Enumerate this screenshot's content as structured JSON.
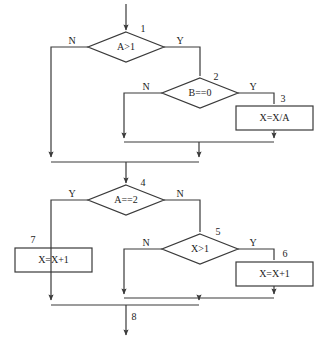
{
  "diagram": {
    "type": "flowchart",
    "background_color": "#ffffff",
    "line_color": "#3a3a3a",
    "text_color": "#1c1c1c",
    "entry_arrow": {
      "name": "entry",
      "x": 126,
      "y_start": 4,
      "y_end": 32
    },
    "exit_arrow": {
      "name": "exit",
      "x": 126,
      "y_start": 312,
      "y_end": 337,
      "label": "8"
    },
    "nodes": [
      {
        "id": "n1",
        "step": "1",
        "shape": "diamond",
        "text": "A>1",
        "cx": 126,
        "cy": 47,
        "hw": 38,
        "hh": 15,
        "step_x": 143,
        "step_y": 30,
        "yes_label": "Y",
        "yes_x": 180,
        "yes_y": 42,
        "no_label": "N",
        "no_x": 72,
        "no_y": 42
      },
      {
        "id": "n2",
        "step": "2",
        "shape": "diamond",
        "text": "B==0",
        "cx": 200,
        "cy": 93,
        "hw": 38,
        "hh": 15,
        "step_x": 216,
        "step_y": 78,
        "yes_label": "Y",
        "yes_x": 253,
        "yes_y": 88,
        "no_label": "N",
        "no_x": 146,
        "no_y": 88
      },
      {
        "id": "n3",
        "step": "3",
        "shape": "rect",
        "text": "X=X/A",
        "x": 236,
        "y": 106,
        "w": 77,
        "h": 24,
        "step_x": 283,
        "step_y": 100
      },
      {
        "id": "n4",
        "step": "4",
        "shape": "diamond",
        "text": "A==2",
        "cx": 126,
        "cy": 200,
        "hw": 38,
        "hh": 15,
        "step_x": 143,
        "step_y": 184,
        "yes_label": "Y",
        "yes_x": 72,
        "yes_y": 195,
        "no_label": "N",
        "no_x": 180,
        "no_y": 195
      },
      {
        "id": "n5",
        "step": "5",
        "shape": "diamond",
        "text": "X>1",
        "cx": 200,
        "cy": 249,
        "hw": 38,
        "hh": 15,
        "step_x": 218,
        "step_y": 233,
        "yes_label": "Y",
        "yes_x": 253,
        "yes_y": 244,
        "no_label": "N",
        "no_x": 146,
        "no_y": 244
      },
      {
        "id": "n6",
        "step": "6",
        "shape": "rect",
        "text": "X=X+1",
        "x": 236,
        "y": 262,
        "w": 77,
        "h": 24,
        "step_x": 285,
        "step_y": 255
      },
      {
        "id": "n7",
        "step": "7",
        "shape": "rect",
        "text": "X=X+1",
        "x": 15,
        "y": 248,
        "w": 77,
        "h": 24,
        "step_x": 33,
        "step_y": 241
      }
    ],
    "edges": [
      {
        "name": "entry-to-n1",
        "points": "126,4 126,30",
        "arrow": true
      },
      {
        "name": "n1-no-left",
        "points": "88,47 51,47 51,157",
        "arrow": true
      },
      {
        "name": "n1-yes-right",
        "points": "164,47 200,47 200,76",
        "arrow": false
      },
      {
        "name": "n2-no-left",
        "points": "162,93 124,93 124,138",
        "arrow": true
      },
      {
        "name": "n2-yes-right",
        "points": "238,93 274,93 274,104",
        "arrow": false
      },
      {
        "name": "n3-bottom-down",
        "points": "274,130 274,138",
        "arrow": true
      },
      {
        "name": "inner-merge-upper",
        "points": "124,142 274,142",
        "arrow": false
      },
      {
        "name": "inner-merge-down",
        "points": "199,142 199,157",
        "arrow": true
      },
      {
        "name": "outer-merge-upper",
        "points": "51,162 199,162",
        "arrow": false
      },
      {
        "name": "merge-to-n4",
        "points": "126,162 126,183",
        "arrow": true
      },
      {
        "name": "n4-yes-left",
        "points": "88,200 51,200 51,300",
        "arrow": true
      },
      {
        "name": "n4-no-right",
        "points": "164,200 200,200 200,232",
        "arrow": false
      },
      {
        "name": "n5-no-left",
        "points": "162,249 124,249 124,294",
        "arrow": true
      },
      {
        "name": "n5-yes-right",
        "points": "238,249 274,249 274,260",
        "arrow": false
      },
      {
        "name": "n6-bottom-down",
        "points": "274,286 274,294",
        "arrow": true
      },
      {
        "name": "inner-merge-lower",
        "points": "124,298 274,298",
        "arrow": false
      },
      {
        "name": "inner-merge-lower-down",
        "points": "199,298 199,300",
        "arrow": true
      },
      {
        "name": "outer-merge-lower",
        "points": "51,305 199,305",
        "arrow": false
      },
      {
        "name": "exit-down",
        "points": "126,305 126,335",
        "arrow": true
      }
    ]
  }
}
